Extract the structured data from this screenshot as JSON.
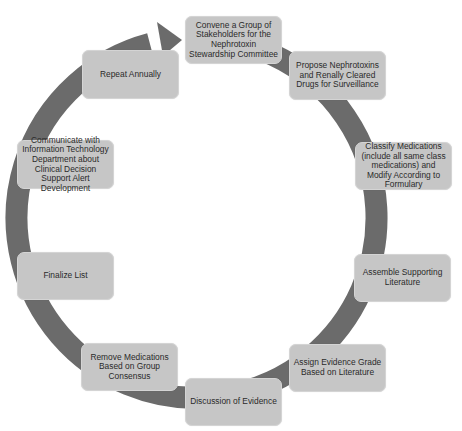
{
  "diagram": {
    "type": "cycle",
    "colors": {
      "ring": "#6b6b6b",
      "box_fill": "#c6c6c6",
      "text": "#2a2a2a",
      "background": "#ffffff"
    },
    "steps": [
      {
        "label": "Convene a Group of Stakeholders for the Nephrotoxin Stewardship Committee"
      },
      {
        "label": "Propose Nephrotoxins and Renally Cleared Drugs for Surveillance"
      },
      {
        "label": "Classify Medications (include all same class medications) and Modify According to Formulary"
      },
      {
        "label": "Assemble Supporting Literature"
      },
      {
        "label": "Assign Evidence Grade Based on Literature"
      },
      {
        "label": "Discussion of Evidence"
      },
      {
        "label": "Remove Medications Based on Group Consensus"
      },
      {
        "label": "Finalize List"
      },
      {
        "label": "Communicate with Information Technology Department about Clinical Decision Support Alert Development"
      },
      {
        "label": "Repeat Annually"
      }
    ]
  }
}
